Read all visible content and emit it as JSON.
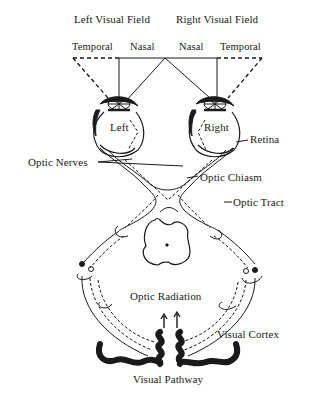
{
  "diagram": {
    "title": "Visual Pathway",
    "fields": {
      "left": "Left Visual Field",
      "right": "Right Visual Field"
    },
    "field_halves": [
      "Temporal",
      "Nasal",
      "Nasal",
      "Temporal"
    ],
    "eyes": {
      "left": "Left",
      "right": "Right"
    },
    "labels": {
      "retina": "Retina",
      "optic_nerves": "Optic Nerves",
      "optic_chiasm": "Optic Chiasm",
      "optic_tract": "Optic Tract",
      "optic_radiation": "Optic Radiation",
      "visual_cortex": "Visual Cortex"
    },
    "colors": {
      "ink": "#1a1a1a",
      "background": "#ffffff"
    }
  }
}
